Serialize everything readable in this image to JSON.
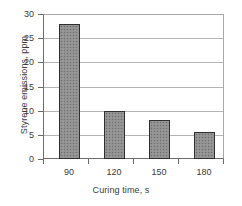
{
  "chart_data": {
    "type": "bar",
    "title": "",
    "categories": [
      "90",
      "120",
      "150",
      "180"
    ],
    "values": [
      28,
      10,
      8,
      5.6
    ],
    "series": [
      {
        "name": "Styrene emissions",
        "values": [
          28,
          10,
          8,
          5.6
        ]
      }
    ],
    "xlabel": "Curing time, s",
    "ylabel": "Styrene emissions, ppm",
    "ylim": [
      0,
      30
    ],
    "yticks": [
      0,
      5,
      10,
      15,
      20,
      25,
      30
    ],
    "ytick_labels": [
      "0",
      "5",
      "10",
      "15",
      "20",
      "25",
      "30"
    ],
    "xtick_labels": [
      "90",
      "120",
      "150",
      "180"
    ],
    "grid": true,
    "grid_axis": "y",
    "legend": false,
    "legend_position": "none",
    "bar_fill_color": "#8f8f8f",
    "bar_edge_color": "#2f2f2f",
    "bar_pattern": "dotted",
    "grid_color": "#b4b4b4",
    "axis_color": "#6b6b6b",
    "background_color": "#ffffff",
    "text_color": "#3a3a3a"
  }
}
